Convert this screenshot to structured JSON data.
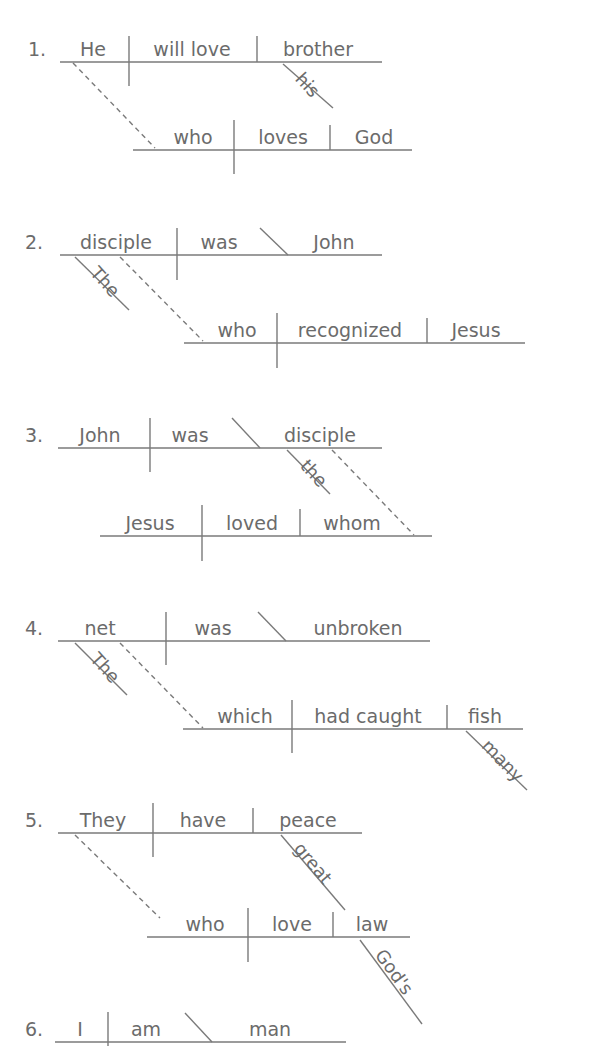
{
  "colors": {
    "ink": "#6b6b6b",
    "line": "#7a7a7a",
    "background": "#ffffff"
  },
  "diagrams": [
    {
      "number": "1.",
      "main": {
        "subject": "He",
        "verb": "will love",
        "object": "brother",
        "modifiers": [
          "his"
        ]
      },
      "clause": {
        "subject": "who",
        "verb": "loves",
        "object": "God",
        "modifiers": []
      }
    },
    {
      "number": "2.",
      "main": {
        "subject": "disciple",
        "verb": "was",
        "complement": "John",
        "modifiers": [
          "The"
        ]
      },
      "clause": {
        "subject": "who",
        "verb": "recognized",
        "object": "Jesus",
        "modifiers": []
      }
    },
    {
      "number": "3.",
      "main": {
        "subject": "John",
        "verb": "was",
        "complement": "disciple",
        "modifiers": [
          "the"
        ]
      },
      "clause": {
        "subject": "Jesus",
        "verb": "loved",
        "object": "whom",
        "modifiers": []
      }
    },
    {
      "number": "4.",
      "main": {
        "subject": "net",
        "verb": "was",
        "complement": "unbroken",
        "modifiers": [
          "The"
        ]
      },
      "clause": {
        "subject": "which",
        "verb": "had caught",
        "object": "fish",
        "modifiers": [
          "many"
        ]
      }
    },
    {
      "number": "5.",
      "main": {
        "subject": "They",
        "verb": "have",
        "object": "peace",
        "modifiers": [
          "great"
        ]
      },
      "clause": {
        "subject": "who",
        "verb": "love",
        "object": "law",
        "modifiers": [
          "God's"
        ]
      }
    },
    {
      "number": "6.",
      "main": {
        "subject": "I",
        "verb": "am",
        "complement": "man",
        "modifiers": []
      }
    }
  ]
}
